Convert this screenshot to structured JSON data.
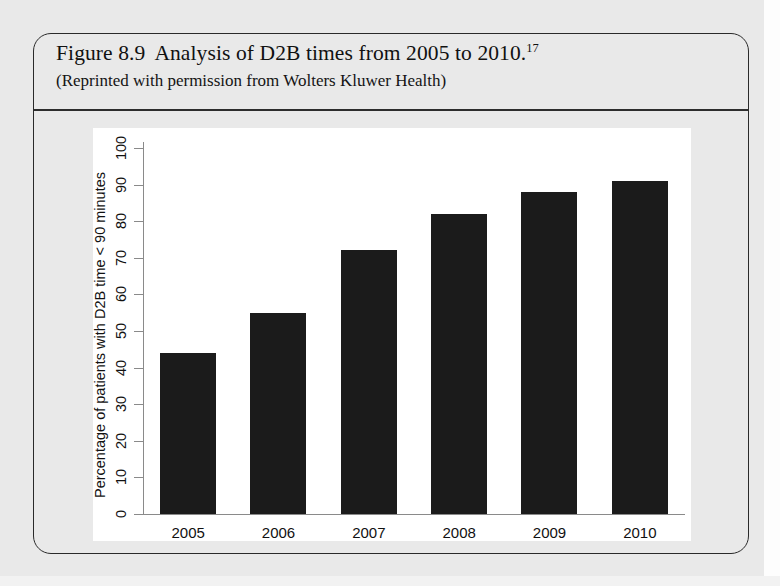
{
  "figure": {
    "caption_number": "Figure 8.9",
    "caption_text": "Analysis of D2B times from 2005 to 2010.",
    "caption_footnote": "17",
    "credit_line": "(Reprinted with permission from Wolters Kluwer Health)"
  },
  "chart_data": {
    "type": "bar",
    "title": "",
    "xlabel": "",
    "ylabel": "Percentage of patients with D2B time < 90 minutes",
    "categories": [
      "2005",
      "2006",
      "2007",
      "2008",
      "2009",
      "2010"
    ],
    "values": [
      44,
      55,
      72,
      82,
      88,
      91
    ],
    "ylim": [
      0,
      100
    ],
    "yticks": [
      0,
      10,
      20,
      30,
      40,
      50,
      60,
      70,
      80,
      90,
      100
    ],
    "ytick_labels": [
      "0",
      "10",
      "20",
      "30",
      "40",
      "50",
      "60",
      "70",
      "80",
      "90",
      "100"
    ],
    "grid": false,
    "legend": false,
    "bar_color": "#1b1b1b",
    "panel_background": "#ffffff"
  },
  "colors": {
    "page_background": "#e9e9e9",
    "box_border": "#2a2a2a",
    "axis": "#8a8a8a",
    "text": "#111111"
  }
}
